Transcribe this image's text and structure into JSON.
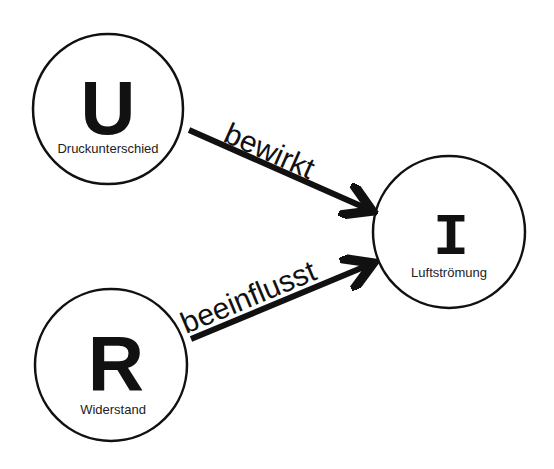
{
  "nodes": [
    {
      "id": "U",
      "symbol": "U",
      "label": "Druckunterschied",
      "cx": 108,
      "cy": 109,
      "r": 75
    },
    {
      "id": "I",
      "symbol": "I",
      "label": "Luftströmung",
      "cx": 449,
      "cy": 232,
      "r": 76
    },
    {
      "id": "R",
      "symbol": "R",
      "label": "Widerstand",
      "cx": 111,
      "cy": 365,
      "r": 76
    }
  ],
  "edges": [
    {
      "from": "U",
      "to": "I",
      "label": "bewirkt"
    },
    {
      "from": "R",
      "to": "I",
      "label": "beeinflusst"
    }
  ],
  "colors": {
    "stroke": "#111111",
    "background": "#ffffff"
  }
}
